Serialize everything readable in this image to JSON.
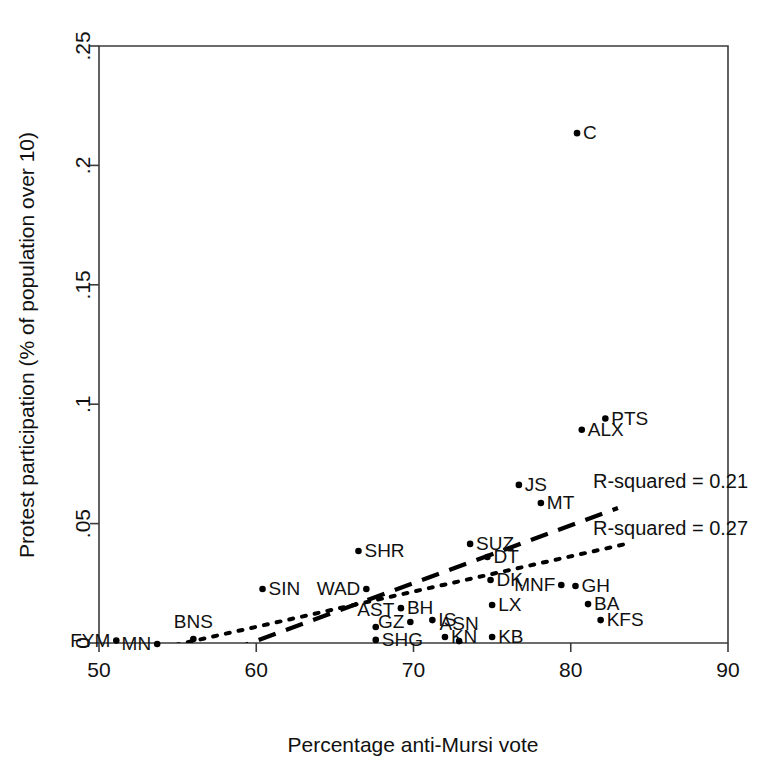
{
  "chart_data": {
    "type": "scatter",
    "title": "",
    "xlabel": "Percentage anti-Mursi vote",
    "ylabel": "Protest participation (% of population over 10)",
    "xlim": [
      50,
      90
    ],
    "ylim": [
      0,
      0.25
    ],
    "xticks": [
      "50",
      "60",
      "70",
      "80",
      "90"
    ],
    "xtick_values": [
      50,
      60,
      70,
      80,
      90
    ],
    "yticks": [
      "0",
      ".05",
      ".1",
      ".15",
      ".2",
      ".25"
    ],
    "ytick_values": [
      0,
      0.05,
      0.1,
      0.15,
      0.2,
      0.25
    ],
    "grid": false,
    "legend_position": "inside-right",
    "points": [
      {
        "label": "FYM",
        "x": 51.1,
        "y": 0.001,
        "lx": -1,
        "ly": 0
      },
      {
        "label": "MN",
        "x": 53.7,
        "y": -0.0004,
        "lx": -1,
        "ly": 0
      },
      {
        "label": "BNS",
        "x": 56.0,
        "y": 0.0017,
        "lx": 0,
        "ly": -1
      },
      {
        "label": "SIN",
        "x": 60.4,
        "y": 0.0226,
        "lx": 1,
        "ly": 0
      },
      {
        "label": "SHR",
        "x": 66.5,
        "y": 0.0385,
        "lx": 1,
        "ly": 0
      },
      {
        "label": "WAD",
        "x": 67.0,
        "y": 0.0226,
        "lx": -1,
        "ly": 0
      },
      {
        "label": "AST",
        "x": 67.6,
        "y": 0.0067,
        "lx": 0,
        "ly": -1
      },
      {
        "label": "SHG",
        "x": 67.6,
        "y": 0.0013,
        "lx": 1,
        "ly": 0
      },
      {
        "label": "GZ",
        "x": 69.8,
        "y": 0.0088,
        "lx": -1,
        "ly": 0
      },
      {
        "label": "BH",
        "x": 69.2,
        "y": 0.0146,
        "lx": 1,
        "ly": 0
      },
      {
        "label": "IS",
        "x": 71.2,
        "y": 0.0096,
        "lx": 1,
        "ly": 0
      },
      {
        "label": "KN",
        "x": 72.0,
        "y": 0.0025,
        "lx": 1,
        "ly": 0
      },
      {
        "label": "ASN",
        "x": 72.9,
        "y": 0.0008,
        "lx": 0,
        "ly": -1
      },
      {
        "label": "SUZ",
        "x": 73.6,
        "y": 0.0415,
        "lx": 1,
        "ly": 0
      },
      {
        "label": "DT",
        "x": 74.7,
        "y": 0.036,
        "lx": 1,
        "ly": 0
      },
      {
        "label": "DK",
        "x": 74.9,
        "y": 0.0264,
        "lx": 1,
        "ly": 0
      },
      {
        "label": "LX",
        "x": 75.0,
        "y": 0.0159,
        "lx": 1,
        "ly": 0
      },
      {
        "label": "KB",
        "x": 75.0,
        "y": 0.0025,
        "lx": 1,
        "ly": 0
      },
      {
        "label": "JS",
        "x": 76.7,
        "y": 0.0662,
        "lx": 1,
        "ly": 0
      },
      {
        "label": "MT",
        "x": 78.1,
        "y": 0.0586,
        "lx": 1,
        "ly": 0
      },
      {
        "label": "MNF",
        "x": 79.4,
        "y": 0.0243,
        "lx": -1,
        "ly": 0
      },
      {
        "label": "GH",
        "x": 80.3,
        "y": 0.0239,
        "lx": 1,
        "ly": 0
      },
      {
        "label": "C",
        "x": 80.4,
        "y": 0.2135,
        "lx": 1,
        "ly": 0
      },
      {
        "label": "ALX",
        "x": 80.7,
        "y": 0.0893,
        "lx": 1,
        "ly": 0
      },
      {
        "label": "BA",
        "x": 81.1,
        "y": 0.0163,
        "lx": 1,
        "ly": 0
      },
      {
        "label": "KFS",
        "x": 81.9,
        "y": 0.0096,
        "lx": 1,
        "ly": 0
      },
      {
        "label": "PTS",
        "x": 82.2,
        "y": 0.094,
        "lx": 1,
        "ly": 0
      }
    ],
    "fit_lines": [
      {
        "name": "dashed-fit",
        "style": "dashed",
        "annotation": "R-squared = 0.21",
        "x0": 51.5,
        "y0": -0.0197,
        "x1": 83.0,
        "y1": 0.0565,
        "annot_x": 593,
        "annot_y": 488
      },
      {
        "name": "dotted-fit",
        "style": "dotted",
        "annotation": "R-squared = 0.27",
        "x0": 50.0,
        "y0": -0.008,
        "x1": 83.8,
        "y1": 0.0419,
        "annot_x": 593,
        "annot_y": 535
      }
    ]
  },
  "annotations": {
    "r_squared_dashed": "R-squared = 0.21",
    "r_squared_dotted": "R-squared = 0.27"
  },
  "axes": {
    "x_title": "Percentage anti-Mursi vote",
    "y_title": "Protest participation (% of population over 10)"
  },
  "colors": {
    "axis": "#3b3b3b",
    "point": "#000000",
    "text": "#111111",
    "background": "#ffffff"
  }
}
